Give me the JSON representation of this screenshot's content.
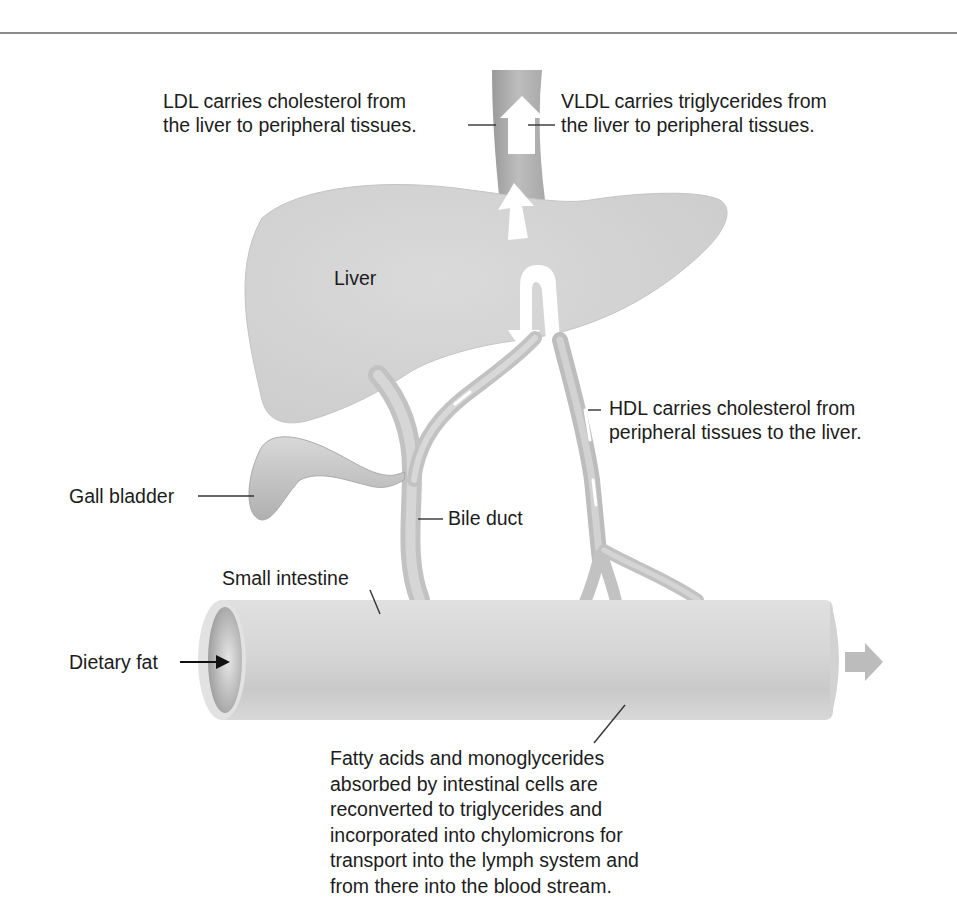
{
  "figure": {
    "labels": {
      "ldl": "LDL carries cholesterol from\nthe liver to peripheral tissues.",
      "vldl": "VLDL carries triglycerides from\nthe liver to peripheral tissues.",
      "liver": "Liver",
      "hdl": "HDL carries cholesterol from\nperipheral tissues to the liver.",
      "gall_bladder": "Gall bladder",
      "bile_duct": "Bile duct",
      "small_intestine": "Small intestine",
      "dietary_fat": "Dietary fat",
      "absorption": "Fatty acids and monoglycerides\nabsorbed by intestinal cells are\nreconverted to triglycerides and\nincorporated into chylomicrons for\ntransport into the lymph system and\nfrom there into the blood stream."
    },
    "colors": {
      "organ_fill": "#d4d4d4",
      "organ_shade": "#b8b8b8",
      "vessel_fill": "#c6c6c6",
      "arrow_fill": "#ffffff",
      "leader_line": "#333333",
      "rule": "#8a8a8a"
    }
  }
}
